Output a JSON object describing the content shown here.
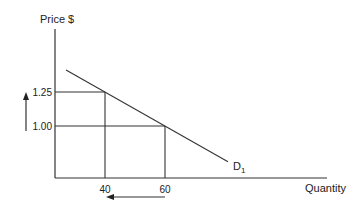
{
  "chart_data": {
    "type": "line",
    "title": "",
    "xlabel": "Quantity",
    "ylabel": "Price $",
    "y_ticks": [
      {
        "value": 1.25,
        "label": "1.25"
      },
      {
        "value": 1.0,
        "label": "1.00"
      }
    ],
    "x_ticks": [
      {
        "value": 40,
        "label": "40"
      },
      {
        "value": 60,
        "label": "60"
      }
    ],
    "series": [
      {
        "name": "D1",
        "label_main": "D",
        "label_sub": "1",
        "points": [
          {
            "x": 40,
            "y": 1.25
          },
          {
            "x": 60,
            "y": 1.0
          }
        ]
      }
    ],
    "annotations": [
      {
        "type": "arrow",
        "direction": "up",
        "meaning": "price rises from 1.00 to 1.25"
      },
      {
        "type": "arrow",
        "direction": "left",
        "meaning": "quantity falls from 60 to 40"
      }
    ],
    "grid": false,
    "legend": "none"
  }
}
